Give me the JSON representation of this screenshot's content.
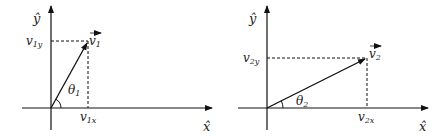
{
  "diagrams": [
    {
      "id": "vector-1",
      "y_axis_label": "ŷ",
      "x_axis_label": "x̂",
      "vector_label": "v",
      "vector_subscript": "1",
      "y_component_label": "v",
      "y_component_subscript": "1y",
      "x_component_label": "v",
      "x_component_subscript": "1x",
      "angle_label": "θ",
      "angle_subscript": "1",
      "origin": [
        51,
        108
      ],
      "tip": [
        88,
        41
      ]
    },
    {
      "id": "vector-2",
      "y_axis_label": "ŷ",
      "x_axis_label": "x̂",
      "vector_label": "v",
      "vector_subscript": "2",
      "y_component_label": "v",
      "y_component_subscript": "2y",
      "x_component_label": "v",
      "x_component_subscript": "2x",
      "angle_label": "θ",
      "angle_subscript": "2",
      "origin": [
        267,
        108
      ],
      "tip": [
        367,
        58
      ]
    }
  ],
  "colors": {
    "line": "#111111",
    "background": "#ffffff"
  }
}
